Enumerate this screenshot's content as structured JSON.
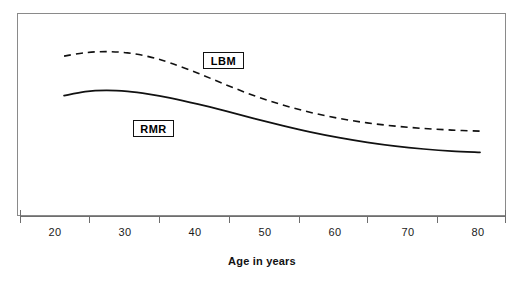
{
  "chart_data": {
    "type": "line",
    "title": "",
    "subtitle": "",
    "xlabel": "Age in years",
    "ylabel": "",
    "xlim": [
      20,
      80
    ],
    "ylim": [
      0,
      100
    ],
    "grid": false,
    "legend_position": "inline-annotation",
    "xticks": [
      20,
      30,
      40,
      50,
      60,
      70,
      80
    ],
    "xticklabels": [
      "20",
      "30",
      "40",
      "50",
      "60",
      "70",
      "80"
    ],
    "yticks": [],
    "yticklabels": [],
    "series": [
      {
        "name": "LBM",
        "label": "LBM",
        "style": "dashed",
        "color": "#111111",
        "annotation": "LBM",
        "x": [
          21,
          24,
          27,
          30,
          33,
          36,
          40,
          44,
          48,
          52,
          56,
          60,
          64,
          68,
          72,
          76,
          80
        ],
        "values": [
          85.5,
          87.4,
          88.0,
          87.3,
          85.2,
          81.8,
          76.0,
          69.5,
          63.5,
          58.4,
          54.2,
          50.9,
          48.4,
          46.6,
          45.3,
          44.4,
          43.8
        ]
      },
      {
        "name": "RMR",
        "label": "RMR",
        "style": "solid",
        "color": "#111111",
        "annotation": "RMR",
        "x": [
          21,
          24,
          27,
          30,
          33,
          36,
          40,
          44,
          48,
          52,
          56,
          60,
          64,
          68,
          72,
          76,
          80
        ],
        "values": [
          63.5,
          65.8,
          66.5,
          65.9,
          64.4,
          62.3,
          58.8,
          54.9,
          50.8,
          46.9,
          43.3,
          40.2,
          37.6,
          35.5,
          33.9,
          32.7,
          32.0
        ]
      }
    ],
    "annotations": [
      {
        "text": "LBM",
        "boxed": true,
        "x": 40.5,
        "y": 77.5
      },
      {
        "text": "RMR",
        "boxed": true,
        "x": 32.0,
        "y": 55.0
      }
    ]
  },
  "axis": {
    "title": "Age in years"
  },
  "colors": {
    "frame": "#8a8a8a",
    "axis": "#6e6e6e",
    "curve": "#111111",
    "text": "#1a1a1a",
    "background": "#ffffff"
  },
  "ticks": [
    {
      "label": "20",
      "left": 35
    },
    {
      "label": "30",
      "left": 105
    },
    {
      "label": "40",
      "left": 175
    },
    {
      "label": "50",
      "left": 245
    },
    {
      "label": "60",
      "left": 315
    },
    {
      "label": "70",
      "left": 388
    },
    {
      "label": "80",
      "left": 458
    }
  ]
}
